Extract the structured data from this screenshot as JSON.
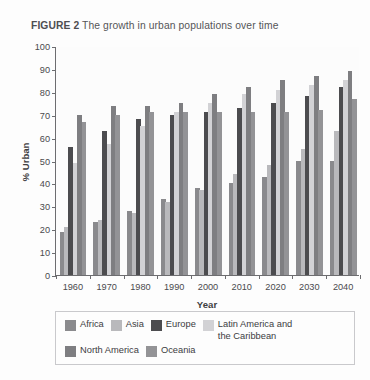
{
  "title": {
    "figure_number": "FIGURE 2",
    "caption": "The growth in urban populations over time"
  },
  "axes": {
    "ylabel": "% Urban",
    "xlabel": "Year",
    "yticks": [
      "100",
      "90",
      "80",
      "70",
      "60",
      "50",
      "40",
      "30",
      "20",
      "10",
      "0"
    ],
    "xticks": [
      "1960",
      "1970",
      "1980",
      "1990",
      "2000",
      "2010",
      "2020",
      "2030",
      "2040"
    ]
  },
  "legend": {
    "row1": [
      {
        "label": "Africa",
        "color": "#8a8a8d"
      },
      {
        "label": "Asia",
        "color": "#b9b9bc"
      },
      {
        "label": "Europe",
        "color": "#4c4c4f"
      },
      {
        "label": "Latin America and\nthe Caribbean",
        "color": "#d2d2d5"
      }
    ],
    "row2": [
      {
        "label": "North America",
        "color": "#7e7e81"
      },
      {
        "label": "Oceania",
        "color": "#939396"
      }
    ]
  },
  "chart_data": {
    "type": "bar",
    "title": "FIGURE 2 The growth in urban populations over time",
    "xlabel": "Year",
    "ylabel": "% Urban",
    "ylim": [
      0,
      100
    ],
    "ytick_step": 10,
    "grid": false,
    "legend_position": "bottom",
    "categories": [
      "1960",
      "1970",
      "1980",
      "1990",
      "2000",
      "2010",
      "2020",
      "2030",
      "2040"
    ],
    "series": [
      {
        "name": "Africa",
        "color": "#8a8a8d",
        "values": [
          19,
          23,
          28,
          33,
          38,
          40,
          43,
          50,
          50
        ]
      },
      {
        "name": "Asia",
        "color": "#b9b9bc",
        "values": [
          21,
          24,
          27,
          32,
          37,
          44,
          48,
          55,
          63
        ]
      },
      {
        "name": "Europe",
        "color": "#4c4c4f",
        "values": [
          56,
          63,
          68,
          70,
          71,
          73,
          75,
          78,
          82
        ]
      },
      {
        "name": "Latin America and the Caribbean",
        "color": "#d2d2d5",
        "values": [
          49,
          57,
          65,
          71,
          75,
          79,
          81,
          83,
          85
        ]
      },
      {
        "name": "North America",
        "color": "#7e7e81",
        "values": [
          70,
          74,
          74,
          75,
          79,
          82,
          85,
          87,
          89
        ]
      },
      {
        "name": "Oceania",
        "color": "#939396",
        "values": [
          67,
          70,
          71,
          71,
          71,
          71,
          71,
          72,
          77
        ]
      }
    ]
  }
}
